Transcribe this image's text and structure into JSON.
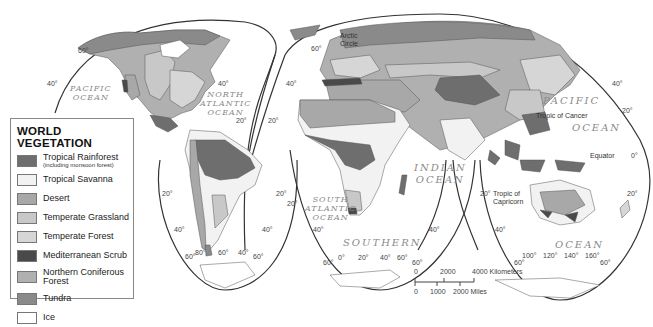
{
  "map": {
    "projection": "interrupted-homolosine",
    "colors": {
      "tropical_rainforest": "#6e6e6e",
      "tropical_savanna": "#f2f2f2",
      "desert": "#a8a8a8",
      "temperate_grassland": "#c8c8c8",
      "temperate_forest": "#d6d6d6",
      "mediterranean_scrub": "#4a4a4a",
      "northern_coniferous_forest": "#b0b0b0",
      "tundra": "#8a8a8a",
      "ice": "#ffffff",
      "outline": "#333333",
      "ocean_label": "#8a8a8a"
    }
  },
  "legend": {
    "title": "WORLD VEGETATION",
    "items": [
      {
        "label": "Tropical Rainforest",
        "sublabel": "(including monsoon forest)",
        "color": "#6e6e6e"
      },
      {
        "label": "Tropical Savanna",
        "color": "#f2f2f2"
      },
      {
        "label": "Desert",
        "color": "#a8a8a8"
      },
      {
        "label": "Temperate Grassland",
        "color": "#c8c8c8"
      },
      {
        "label": "Temperate Forest",
        "color": "#d6d6d6"
      },
      {
        "label": "Mediterranean Scrub",
        "color": "#4a4a4a"
      },
      {
        "label": "Northern Coniferous",
        "label2": "Forest",
        "color": "#b0b0b0"
      },
      {
        "label": "Tundra",
        "color": "#8a8a8a"
      },
      {
        "label": "Ice",
        "color": "#ffffff"
      }
    ]
  },
  "oceans": {
    "pacific_west": "PACIFIC\nOCEAN",
    "north_atlantic": "NORTH\nATLANTIC\nOCEAN",
    "atlantic_mid": "ATLANTIC\nOCEAN",
    "south_atlantic": "SOUTH\nATLANTIC\nOCEAN",
    "indian": "INDIAN\nOCEAN",
    "southern": "SOUTHERN",
    "pacific_east_1": "PACIFIC",
    "pacific_east_2": "OCEAN",
    "ocean_southeast": "OCEAN"
  },
  "annotations": {
    "arctic_circle": "Arctic\nCircle",
    "tropic_cancer": "Tropic of Cancer",
    "tropic_capricorn": "Tropic of\nCapricorn",
    "equator": "Equator"
  },
  "degrees": {
    "d60": "60°",
    "d40": "40°",
    "d20": "20°",
    "d0": "0°",
    "d80": "80°",
    "d100": "100°",
    "d120": "120°",
    "d140": "140°",
    "d160": "160°"
  },
  "scale": {
    "km_labels": [
      "0",
      "2000",
      "4000 Kilometers"
    ],
    "mi_labels": [
      "0",
      "1000",
      "2000 Miles"
    ]
  }
}
